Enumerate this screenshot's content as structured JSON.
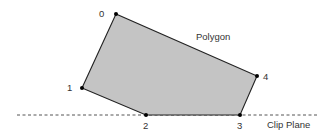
{
  "diagram": {
    "polygon": {
      "label": "Polygon",
      "fill_color": "#c4c4c4",
      "stroke_color": "#222222",
      "vertices": [
        {
          "id": "0",
          "label": "0"
        },
        {
          "id": "1",
          "label": "1"
        },
        {
          "id": "2",
          "label": "2"
        },
        {
          "id": "3",
          "label": "3"
        },
        {
          "id": "4",
          "label": "4"
        }
      ]
    },
    "clip_plane": {
      "label": "Clip Plane",
      "style": "dashed",
      "color": "#555555"
    },
    "vertex_marker_color": "#000000"
  }
}
